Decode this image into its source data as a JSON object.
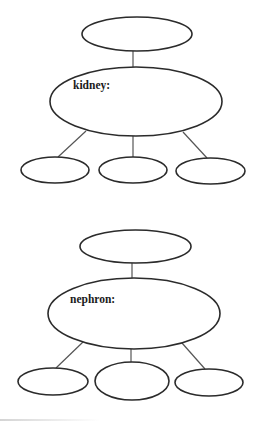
{
  "diagrams": [
    {
      "name": "kidney-concept-map",
      "center_label": "kidney:",
      "top_node": {
        "label": ""
      },
      "child_nodes": [
        {
          "label": ""
        },
        {
          "label": ""
        },
        {
          "label": ""
        }
      ]
    },
    {
      "name": "nephron-concept-map",
      "center_label": "nephron:",
      "top_node": {
        "label": ""
      },
      "child_nodes": [
        {
          "label": ""
        },
        {
          "label": ""
        },
        {
          "label": ""
        }
      ]
    }
  ],
  "colors": {
    "stroke": "#2b2b2b",
    "connector": "#555555",
    "fill": "#ffffff",
    "text": "#1a1a1a"
  }
}
